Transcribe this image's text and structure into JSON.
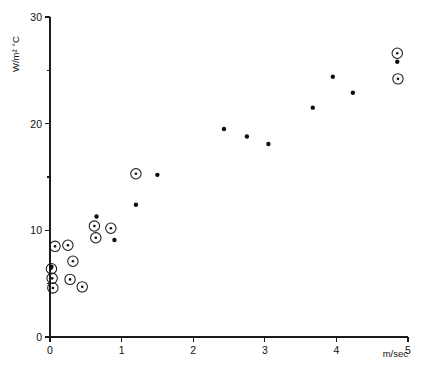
{
  "chart_data": {
    "type": "scatter",
    "title": "",
    "xlabel": "m/sec",
    "ylabel": "W/m² °C",
    "xlim": [
      0,
      5
    ],
    "ylim": [
      0,
      30
    ],
    "grid": false,
    "legend": "none",
    "xticks": [
      0,
      1,
      2,
      3,
      4,
      5
    ],
    "xticklabels": [
      "0",
      "1",
      "2",
      "3",
      "4",
      "5"
    ],
    "yticks": [
      0,
      10,
      20,
      30
    ],
    "yticklabels": [
      "0",
      "10",
      "20",
      "30"
    ],
    "yminorticks": [
      5,
      15,
      25
    ],
    "series": [
      {
        "name": "circled-marker",
        "marker": "circle-with-center-dot",
        "points": [
          {
            "x": 0.02,
            "y": 6.4
          },
          {
            "x": 0.03,
            "y": 5.5
          },
          {
            "x": 0.04,
            "y": 4.6
          },
          {
            "x": 0.07,
            "y": 8.5
          },
          {
            "x": 0.25,
            "y": 8.6
          },
          {
            "x": 0.28,
            "y": 5.4
          },
          {
            "x": 0.32,
            "y": 7.1
          },
          {
            "x": 0.45,
            "y": 4.7
          },
          {
            "x": 0.62,
            "y": 10.4
          },
          {
            "x": 0.64,
            "y": 9.3
          },
          {
            "x": 0.85,
            "y": 10.2
          },
          {
            "x": 1.2,
            "y": 15.3
          },
          {
            "x": 4.85,
            "y": 26.6
          },
          {
            "x": 4.86,
            "y": 24.2
          }
        ]
      },
      {
        "name": "plain-dot",
        "marker": "filled-dot",
        "points": [
          {
            "x": 0.02,
            "y": 6.6
          },
          {
            "x": 0.65,
            "y": 11.3
          },
          {
            "x": 0.9,
            "y": 9.1
          },
          {
            "x": 1.2,
            "y": 12.4
          },
          {
            "x": 1.5,
            "y": 15.2
          },
          {
            "x": 2.43,
            "y": 19.5
          },
          {
            "x": 2.75,
            "y": 18.8
          },
          {
            "x": 3.05,
            "y": 18.1
          },
          {
            "x": 3.67,
            "y": 21.5
          },
          {
            "x": 3.95,
            "y": 24.4
          },
          {
            "x": 4.23,
            "y": 22.9
          },
          {
            "x": 4.85,
            "y": 25.8
          }
        ]
      }
    ]
  }
}
